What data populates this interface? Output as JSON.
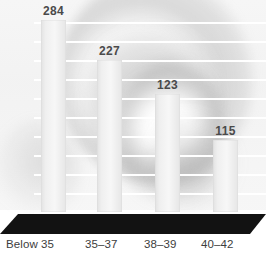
{
  "chart_data": {
    "type": "bar",
    "title": "",
    "xlabel": "",
    "ylabel": "",
    "categories": [
      "Below 35",
      "35–37",
      "38–39",
      "40–42"
    ],
    "values": [
      50.5,
      40,
      31,
      19
    ],
    "data_labels": [
      "284",
      "227",
      "123",
      "115"
    ],
    "ylim": [
      0,
      52
    ],
    "yticks": [
      "0",
      "5",
      "10",
      "15",
      "20",
      "25",
      "30",
      "35",
      "40",
      "45",
      "50"
    ],
    "ytick_values": [
      0,
      5,
      10,
      15,
      20,
      25,
      30,
      35,
      40,
      45,
      50
    ],
    "grid": true,
    "legend": "none",
    "colors": {
      "bar_fill": "#efefef",
      "bar_edge": "#dcdcdc",
      "gridline": "#ffffff",
      "data_label_text": "#4a4a4a",
      "axis_text": "#5d5d5d",
      "xlabel_text": "#3d3d3d",
      "floor": "#111111",
      "background": "#ededed"
    }
  }
}
